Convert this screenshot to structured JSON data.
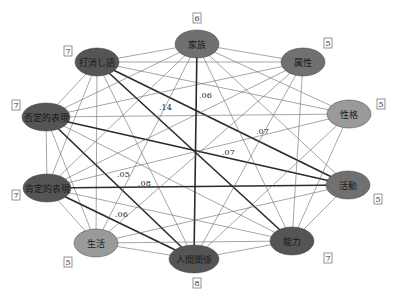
{
  "colors": {
    "dark_node": "#555555",
    "mid_node": "#707070",
    "light_node": "#9a9a9a",
    "edge_thin": "#6a6a6a",
    "edge_thick": "#2a2a2a"
  },
  "nodes": [
    {
      "id": "kazoku",
      "label": "家族",
      "count": "6",
      "x": 197,
      "y": 44,
      "rx": 22,
      "ry": 14,
      "tone": "mid",
      "cx": 197,
      "cy": 18
    },
    {
      "id": "zokusei",
      "label": "属性",
      "count": "5",
      "x": 303,
      "y": 62,
      "rx": 22,
      "ry": 14,
      "tone": "mid",
      "cx": 328,
      "cy": 43
    },
    {
      "id": "seikaku",
      "label": "性格",
      "count": "5",
      "x": 349,
      "y": 114,
      "rx": 22,
      "ry": 14,
      "tone": "light",
      "cx": 381,
      "cy": 104
    },
    {
      "id": "katsudo",
      "label": "活動",
      "count": "5",
      "x": 348,
      "y": 185,
      "rx": 22,
      "ry": 14,
      "tone": "mid",
      "cx": 378,
      "cy": 199
    },
    {
      "id": "noryoku",
      "label": "能力",
      "count": "7",
      "x": 292,
      "y": 241,
      "rx": 22,
      "ry": 14,
      "tone": "dark",
      "cx": 328,
      "cy": 258
    },
    {
      "id": "ningen",
      "label": "人間関係",
      "count": "8",
      "x": 194,
      "y": 259,
      "rx": 25,
      "ry": 14,
      "tone": "dark",
      "cx": 197,
      "cy": 283
    },
    {
      "id": "seikatsu",
      "label": "生活",
      "count": "5",
      "x": 96,
      "y": 243,
      "rx": 22,
      "ry": 14,
      "tone": "light",
      "cx": 68,
      "cy": 262
    },
    {
      "id": "kotei",
      "label": "肯定的表現",
      "count": "7",
      "x": 47,
      "y": 188,
      "rx": 24,
      "ry": 14,
      "tone": "dark",
      "cx": 16,
      "cy": 195
    },
    {
      "id": "hitei",
      "label": "否定的表現",
      "count": "7",
      "x": 46,
      "y": 117,
      "rx": 24,
      "ry": 14,
      "tone": "dark",
      "cx": 16,
      "cy": 105
    },
    {
      "id": "uchikeshi",
      "label": "打消し語",
      "count": "7",
      "x": 97,
      "y": 62,
      "rx": 22,
      "ry": 14,
      "tone": "dark",
      "cx": 68,
      "cy": 51
    }
  ],
  "edges": [
    {
      "a": "uchikeshi",
      "b": "kazoku",
      "w": "thin"
    },
    {
      "a": "uchikeshi",
      "b": "zokusei",
      "w": "thin"
    },
    {
      "a": "uchikeshi",
      "b": "seikaku",
      "w": "thin"
    },
    {
      "a": "uchikeshi",
      "b": "katsudo",
      "w": "thick"
    },
    {
      "a": "uchikeshi",
      "b": "noryoku",
      "w": "thick"
    },
    {
      "a": "uchikeshi",
      "b": "ningen",
      "w": "thin"
    },
    {
      "a": "uchikeshi",
      "b": "seikatsu",
      "w": "thin"
    },
    {
      "a": "uchikeshi",
      "b": "kotei",
      "w": "thin"
    },
    {
      "a": "uchikeshi",
      "b": "hitei",
      "w": "thin"
    },
    {
      "a": "hitei",
      "b": "kazoku",
      "w": "thin"
    },
    {
      "a": "hitei",
      "b": "zokusei",
      "w": "thin"
    },
    {
      "a": "hitei",
      "b": "seikaku",
      "w": "thin"
    },
    {
      "a": "hitei",
      "b": "katsudo",
      "w": "thick"
    },
    {
      "a": "hitei",
      "b": "noryoku",
      "w": "thin"
    },
    {
      "a": "hitei",
      "b": "ningen",
      "w": "thick"
    },
    {
      "a": "hitei",
      "b": "seikatsu",
      "w": "thin"
    },
    {
      "a": "hitei",
      "b": "kotei",
      "w": "thin"
    },
    {
      "a": "kotei",
      "b": "kazoku",
      "w": "thin"
    },
    {
      "a": "kotei",
      "b": "zokusei",
      "w": "thin"
    },
    {
      "a": "kotei",
      "b": "seikaku",
      "w": "thin"
    },
    {
      "a": "kotei",
      "b": "katsudo",
      "w": "thick"
    },
    {
      "a": "kotei",
      "b": "noryoku",
      "w": "thin"
    },
    {
      "a": "kotei",
      "b": "ningen",
      "w": "thick"
    },
    {
      "a": "kotei",
      "b": "seikatsu",
      "w": "thin"
    },
    {
      "a": "kazoku",
      "b": "zokusei",
      "w": "thin"
    },
    {
      "a": "kazoku",
      "b": "seikaku",
      "w": "thin"
    },
    {
      "a": "kazoku",
      "b": "katsudo",
      "w": "thin"
    },
    {
      "a": "kazoku",
      "b": "noryoku",
      "w": "thin"
    },
    {
      "a": "kazoku",
      "b": "ningen",
      "w": "thick"
    },
    {
      "a": "kazoku",
      "b": "seikatsu",
      "w": "thin"
    },
    {
      "a": "zokusei",
      "b": "seikatsu",
      "w": "thin"
    },
    {
      "a": "zokusei",
      "b": "ningen",
      "w": "thin"
    },
    {
      "a": "zokusei",
      "b": "noryoku",
      "w": "thin"
    },
    {
      "a": "seikaku",
      "b": "noryoku",
      "w": "thin"
    },
    {
      "a": "seikaku",
      "b": "ningen",
      "w": "thin"
    },
    {
      "a": "katsudo",
      "b": "noryoku",
      "w": "thin"
    },
    {
      "a": "katsudo",
      "b": "seikatsu",
      "w": "thin"
    },
    {
      "a": "noryoku",
      "b": "ningen",
      "w": "thin"
    },
    {
      "a": "noryoku",
      "b": "seikatsu",
      "w": "thin"
    },
    {
      "a": "ningen",
      "b": "seikatsu",
      "w": "thin"
    }
  ],
  "edge_labels": [
    {
      "text": ".06",
      "x": 199,
      "y": 98
    },
    {
      "text": ".14",
      "x": 159,
      "y": 110
    },
    {
      "text": ".07",
      "x": 256,
      "y": 134
    },
    {
      "text": ".07",
      "x": 222,
      "y": 155
    },
    {
      "text": ".05",
      "x": 117,
      "y": 177
    },
    {
      "text": ".08",
      "x": 138,
      "y": 186
    },
    {
      "text": ".06",
      "x": 115,
      "y": 217
    }
  ]
}
